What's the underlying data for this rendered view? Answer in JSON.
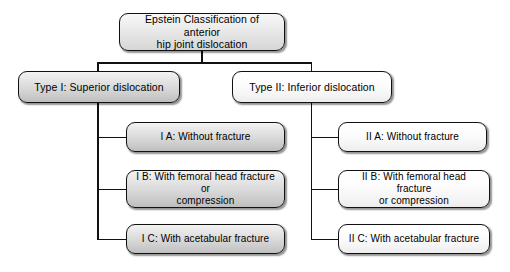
{
  "diagram": {
    "type": "flowchart-tree",
    "title": "Epstein Classification of anterior hip joint dislocation",
    "background_color": "#ffffff",
    "border_color": "#111111",
    "fill_grey": "#d8d8d8",
    "fill_white": "#fbfbfb",
    "root": {
      "label": "Epstein Classification of anterior hip joint dislocation",
      "line1": "Epstein Classification of anterior",
      "line2": "hip joint dislocation"
    },
    "branches": [
      {
        "id": "type-1",
        "label": "Type I: Superior dislocation",
        "children": [
          {
            "id": "type-1-a",
            "line1": "I A: Without fracture",
            "line2": ""
          },
          {
            "id": "type-1-b",
            "line1": "I B: With femoral head fracture or",
            "line2": "compression"
          },
          {
            "id": "type-1-c",
            "line1": "I C: With acetabular fracture",
            "line2": ""
          }
        ]
      },
      {
        "id": "type-2",
        "label": "Type II: Inferior dislocation",
        "children": [
          {
            "id": "type-2-a",
            "line1": "II A: Without fracture",
            "line2": ""
          },
          {
            "id": "type-2-b",
            "line1": "II B: With femoral head fracture",
            "line2": "or compression"
          },
          {
            "id": "type-2-c",
            "line1": "II C: With acetabular fracture",
            "line2": ""
          }
        ]
      }
    ]
  }
}
